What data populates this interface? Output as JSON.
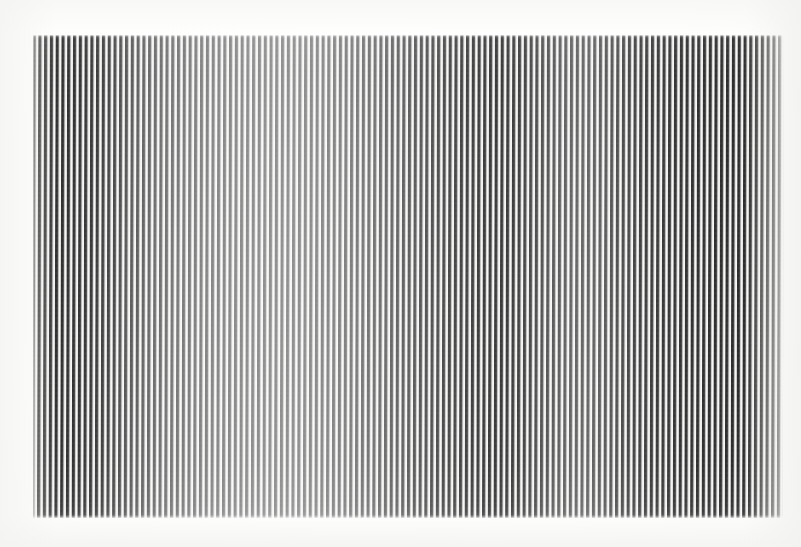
{
  "image": {
    "kind": "photograph-of-printed-plate",
    "subject": "vertical-stripe-op-art-field",
    "caption": "",
    "width_px": 801,
    "height_px": 547
  },
  "canvas": {
    "background_color": "#fdfdfc",
    "page_tone": "#ffffff",
    "edge_tone": "#f4f4f2"
  },
  "stripe_field": {
    "left_px": 33,
    "top_px": 35,
    "width_px": 751,
    "height_px": 483,
    "orientation": "vertical",
    "period_px": 5.78,
    "dark_bar_width_px": 2.5,
    "light_gap_width_px": 3.28,
    "stripe_count": 130,
    "ink_color": "#2c2c2c",
    "paper_color": "#f6f6f4",
    "skew_deg": -0.16
  },
  "chart_data": {
    "type": "bar",
    "title": "",
    "subtitle": "",
    "xlabel": "",
    "ylabel": "",
    "legend_position": "none",
    "grid": false,
    "axis_visible": false,
    "tick_labels": [],
    "annotations": [],
    "xlim": [
      0,
      130
    ],
    "ylim": [
      0,
      1
    ],
    "categories": [
      "1",
      "2",
      "3",
      "4",
      "5",
      "6",
      "7",
      "8",
      "9",
      "10",
      "11",
      "12",
      "13",
      "14",
      "15",
      "16",
      "17",
      "18",
      "19",
      "20",
      "21",
      "22",
      "23",
      "24",
      "25",
      "26",
      "27",
      "28",
      "29",
      "30",
      "31",
      "32",
      "33",
      "34",
      "35",
      "36",
      "37",
      "38",
      "39",
      "40",
      "41",
      "42",
      "43",
      "44",
      "45",
      "46",
      "47",
      "48",
      "49",
      "50",
      "51",
      "52",
      "53",
      "54",
      "55",
      "56",
      "57",
      "58",
      "59",
      "60",
      "61",
      "62",
      "63",
      "64",
      "65",
      "66",
      "67",
      "68",
      "69",
      "70",
      "71",
      "72",
      "73",
      "74",
      "75",
      "76",
      "77",
      "78",
      "79",
      "80",
      "81",
      "82",
      "83",
      "84",
      "85",
      "86",
      "87",
      "88",
      "89",
      "90",
      "91",
      "92",
      "93",
      "94",
      "95",
      "96",
      "97",
      "98",
      "99",
      "100",
      "101",
      "102",
      "103",
      "104",
      "105",
      "106",
      "107",
      "108",
      "109",
      "110",
      "111",
      "112",
      "113",
      "114",
      "115",
      "116",
      "117",
      "118",
      "119",
      "120",
      "121",
      "122",
      "123",
      "124",
      "125",
      "126",
      "127",
      "128",
      "129",
      "130"
    ],
    "series": [
      {
        "name": "stripe-contrast",
        "description": "Relative darkness of each vertical bar, 1.0 = fully black ink, 0.0 = paper white",
        "values": [
          1.0,
          1.0,
          0.99,
          0.99,
          0.98,
          0.98,
          0.97,
          0.97,
          0.96,
          0.95,
          0.94,
          0.92,
          0.9,
          0.88,
          0.86,
          0.83,
          0.8,
          0.78,
          0.76,
          0.74,
          0.72,
          0.7,
          0.69,
          0.67,
          0.66,
          0.65,
          0.64,
          0.63,
          0.62,
          0.61,
          0.6,
          0.59,
          0.59,
          0.58,
          0.58,
          0.57,
          0.57,
          0.56,
          0.56,
          0.56,
          0.55,
          0.55,
          0.55,
          0.55,
          0.55,
          0.55,
          0.56,
          0.56,
          0.57,
          0.57,
          0.58,
          0.59,
          0.6,
          0.61,
          0.62,
          0.63,
          0.64,
          0.66,
          0.67,
          0.68,
          0.7,
          0.71,
          0.73,
          0.74,
          0.76,
          0.77,
          0.79,
          0.8,
          0.82,
          0.83,
          0.84,
          0.86,
          0.87,
          0.88,
          0.89,
          0.9,
          0.91,
          0.92,
          0.93,
          0.93,
          0.94,
          0.93,
          0.92,
          0.91,
          0.89,
          0.87,
          0.85,
          0.83,
          0.81,
          0.79,
          0.77,
          0.76,
          0.75,
          0.74,
          0.74,
          0.74,
          0.75,
          0.76,
          0.78,
          0.8,
          0.82,
          0.84,
          0.86,
          0.88,
          0.9,
          0.91,
          0.92,
          0.93,
          0.94,
          0.95,
          0.96,
          0.96,
          0.97,
          0.97,
          0.98,
          0.98,
          0.98,
          0.99,
          0.99,
          0.99,
          1.0,
          1.0,
          1.0,
          1.0,
          1.0,
          1.0,
          1.0,
          1.0,
          1.0,
          1.0
        ]
      }
    ]
  }
}
